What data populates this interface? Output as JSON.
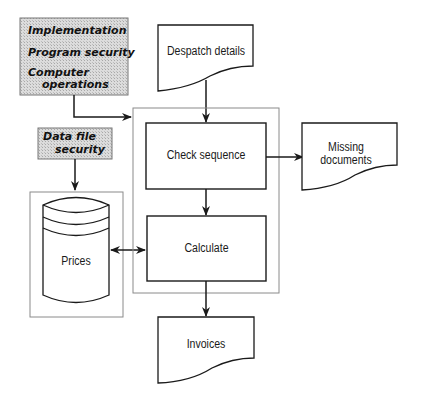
{
  "diagram": {
    "controls": {
      "program_controls": [
        "Implementation",
        "Program security",
        "Computer",
        "operations"
      ],
      "data_file_security": [
        "Data file",
        "security"
      ]
    },
    "documents": {
      "despatch_details": "Despatch details",
      "missing_documents": [
        "Missing",
        "documents"
      ],
      "invoices": "Invoices"
    },
    "processes": {
      "check_sequence": "Check sequence",
      "calculate": "Calculate"
    },
    "storage": {
      "prices": "Prices"
    },
    "colors": {
      "line": "#1a1a1a",
      "container_line": "#8a8a8a",
      "shade": "#d4d4d4"
    }
  }
}
